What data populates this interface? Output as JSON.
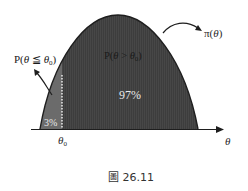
{
  "figure": {
    "caption": "圖 26.11",
    "curve_label_func": "π(",
    "curve_label_var": "θ",
    "curve_label_close": ")",
    "left_prob": {
      "prefix": "P(",
      "var": "θ",
      "op": " ≦ ",
      "var2": "θ",
      "sub": "0",
      "close": ")"
    },
    "right_prob": {
      "prefix": "P(",
      "var": "θ",
      "op": " > ",
      "var2": "θ",
      "sub": "0",
      "close": ")"
    },
    "left_area_pct": "3%",
    "right_area_pct": "97%",
    "axis_tick_label": "θ",
    "axis_tick_sub": "0",
    "axis_label": "θ",
    "colors": {
      "dark_region": "#3f3f3f",
      "light_region": "#6e6e6e",
      "curve_outline": "#1e1e1e",
      "axis": "#1e1e1e",
      "divider": "#ffffff"
    }
  }
}
